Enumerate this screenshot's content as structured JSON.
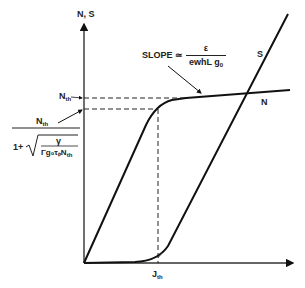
{
  "axes": {
    "y_label": "N, S",
    "x_label": ""
  },
  "curves": {
    "n_label": "N",
    "s_label": "S"
  },
  "slope_annotation": {
    "prefix": "SLOPE ≃",
    "numerator": "ε",
    "denominator_main": "ewhL g",
    "denominator_sub": "0"
  },
  "n_th_label": {
    "main": "N",
    "sub": "th"
  },
  "formula": {
    "numerator_main": "N",
    "numerator_sub": "th",
    "one_plus": "1+",
    "sqrt_numerator": "γ",
    "sqrt_denominator": "Γg₀τₚN",
    "sqrt_denominator_sub": "th"
  },
  "j_th_label": {
    "main": "J",
    "sub": "th"
  },
  "colors": {
    "line": "#111111",
    "background": "#ffffff"
  }
}
